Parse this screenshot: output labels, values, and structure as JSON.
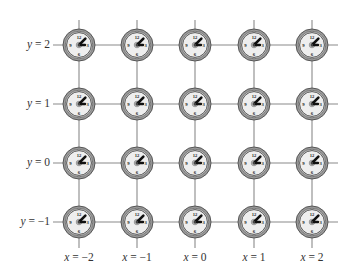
{
  "diagram": {
    "type": "lattice-of-clocks",
    "columns": [
      {
        "x_value": -2,
        "label_var": "x",
        "label_val": "= −2",
        "px": 79
      },
      {
        "x_value": -1,
        "label_var": "x",
        "label_val": "= −1",
        "px": 137
      },
      {
        "x_value": 0,
        "label_var": "x",
        "label_val": "= 0",
        "px": 195
      },
      {
        "x_value": 1,
        "label_var": "x",
        "label_val": "= 1",
        "px": 254
      },
      {
        "x_value": 2,
        "label_var": "x",
        "label_val": "= 2",
        "px": 312
      }
    ],
    "rows": [
      {
        "y_value": 2,
        "label_var": "y",
        "label_val": "= 2",
        "px": 45
      },
      {
        "y_value": 1,
        "label_var": "y",
        "label_val": "= 1",
        "px": 104
      },
      {
        "y_value": 0,
        "label_var": "y",
        "label_val": "= 0",
        "px": 163
      },
      {
        "y_value": -1,
        "label_var": "y",
        "label_val": "= −1",
        "px": 222
      }
    ],
    "clock": {
      "numerals": [
        "12",
        "3",
        "6",
        "9"
      ],
      "long_hand_angle_deg": 45,
      "short_hand_angle_deg": 90,
      "face_color": "#eeeeee",
      "ring_color": "#777777",
      "hand_color": "#111111"
    },
    "grid_line_color": "#8a8a8a"
  }
}
